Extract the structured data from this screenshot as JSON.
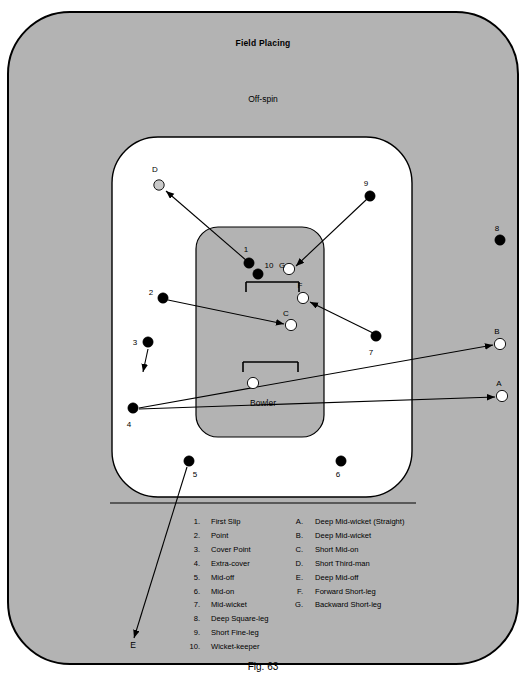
{
  "figure": {
    "title": "Field Placing",
    "subtitle": "Off-spin",
    "bowler_label": "Bowler",
    "caption": "Fig. 63"
  },
  "colors": {
    "outfield": "#b3b3b3",
    "inner_circle": "#ffffff",
    "pitch": "#b3b3b3",
    "fielder_dark": "#000000",
    "fielder_light": "#ffffff",
    "fielder_grey": "#c9c9c9",
    "outline": "#000000",
    "page_background": "#ffffff"
  },
  "fielders": [
    {
      "id": "1",
      "label": "1",
      "x": 249,
      "y": 263,
      "r": 5.2,
      "fill": "dark",
      "label_x": 246,
      "label_y": 252
    },
    {
      "id": "10",
      "label": "10",
      "x": 258,
      "y": 274,
      "r": 5.2,
      "fill": "dark",
      "label_x": 269,
      "label_y": 268
    },
    {
      "id": "2",
      "label": "2",
      "x": 163,
      "y": 298,
      "r": 5.2,
      "fill": "dark",
      "label_x": 151,
      "label_y": 295
    },
    {
      "id": "3",
      "label": "3",
      "x": 148,
      "y": 342,
      "r": 5.2,
      "fill": "dark",
      "label_x": 135,
      "label_y": 345
    },
    {
      "id": "4",
      "label": "4",
      "x": 133,
      "y": 408,
      "r": 5.2,
      "fill": "dark",
      "label_x": 129,
      "label_y": 427
    },
    {
      "id": "5",
      "label": "5",
      "x": 189,
      "y": 461,
      "r": 5.2,
      "fill": "dark",
      "label_x": 195,
      "label_y": 477
    },
    {
      "id": "6",
      "label": "6",
      "x": 341,
      "y": 461,
      "r": 5.2,
      "fill": "dark",
      "label_x": 338,
      "label_y": 477
    },
    {
      "id": "7",
      "label": "7",
      "x": 376,
      "y": 336,
      "r": 5.2,
      "fill": "dark",
      "label_x": 371,
      "label_y": 355
    },
    {
      "id": "8",
      "label": "8",
      "x": 500,
      "y": 240,
      "r": 5.2,
      "fill": "dark",
      "label_x": 497,
      "label_y": 231
    },
    {
      "id": "9",
      "label": "9",
      "x": 370,
      "y": 196,
      "r": 5.2,
      "fill": "dark",
      "label_x": 366,
      "label_y": 186
    },
    {
      "id": "A",
      "label": "A",
      "x": 502,
      "y": 396,
      "r": 5.6,
      "fill": "light",
      "label_x": 499,
      "label_y": 386
    },
    {
      "id": "B",
      "label": "B",
      "x": 500,
      "y": 344,
      "r": 5.6,
      "fill": "light",
      "label_x": 497,
      "label_y": 334
    },
    {
      "id": "C",
      "label": "C",
      "x": 291,
      "y": 325,
      "r": 5.6,
      "fill": "light",
      "label_x": 286,
      "label_y": 316
    },
    {
      "id": "D",
      "label": "D",
      "x": 159,
      "y": 185,
      "r": 5.2,
      "fill": "grey",
      "label_x": 155,
      "label_y": 172
    },
    {
      "id": "F",
      "label": "F",
      "x": 303,
      "y": 298,
      "r": 5.6,
      "fill": "light",
      "label_x": 300,
      "label_y": 288
    },
    {
      "id": "G",
      "label": "G",
      "x": 289,
      "y": 269,
      "r": 5.6,
      "fill": "light",
      "label_x": 282,
      "label_y": 268
    },
    {
      "id": "bowler",
      "label": "",
      "x": 253,
      "y": 383,
      "r": 5.6,
      "fill": "light",
      "label_x": 0,
      "label_y": 0
    }
  ],
  "markers_outside": [
    {
      "id": "E",
      "label": "E",
      "x": 133,
      "y": 648
    }
  ],
  "arrows": [
    {
      "name": "one-to-D",
      "x1": 247,
      "y1": 261,
      "x2": 166,
      "y2": 191
    },
    {
      "name": "nine-to-G",
      "x1": 367,
      "y1": 199,
      "x2": 296,
      "y2": 266
    },
    {
      "name": "two-to-C",
      "x1": 168,
      "y1": 300,
      "x2": 284,
      "y2": 324
    },
    {
      "name": "seven-to-F",
      "x1": 373,
      "y1": 333,
      "x2": 310,
      "y2": 302
    },
    {
      "name": "three-down",
      "x1": 148,
      "y1": 349,
      "x2": 143,
      "y2": 372
    },
    {
      "name": "four-to-B",
      "x1": 139,
      "y1": 408,
      "x2": 493,
      "y2": 345
    },
    {
      "name": "four-to-A",
      "x1": 139,
      "y1": 409,
      "x2": 495,
      "y2": 397
    },
    {
      "name": "five-to-E",
      "x1": 187,
      "y1": 467,
      "x2": 134,
      "y2": 638
    }
  ],
  "legend": {
    "numbered": [
      {
        "key": "1.",
        "text": "First Slip"
      },
      {
        "key": "2.",
        "text": "Point"
      },
      {
        "key": "3.",
        "text": "Cover Point"
      },
      {
        "key": "4.",
        "text": "Extra-cover"
      },
      {
        "key": "5.",
        "text": "Mid-off"
      },
      {
        "key": "6.",
        "text": "Mid-on"
      },
      {
        "key": "7.",
        "text": "Mid-wicket"
      },
      {
        "key": "8.",
        "text": "Deep Square-leg"
      },
      {
        "key": "9.",
        "text": "Short Fine-leg"
      },
      {
        "key": "10.",
        "text": "Wicket-keeper"
      }
    ],
    "lettered": [
      {
        "key": "A.",
        "text": "Deep Mid-wicket (Straight)"
      },
      {
        "key": "B.",
        "text": "Deep Mid-wicket"
      },
      {
        "key": "C.",
        "text": "Short Mid-on"
      },
      {
        "key": "D.",
        "text": "Short Third-man"
      },
      {
        "key": "E.",
        "text": "Deep Mid-off"
      },
      {
        "key": "F.",
        "text": "Forward Short-leg"
      },
      {
        "key": "G.",
        "text": "Backward Short-leg"
      }
    ]
  }
}
